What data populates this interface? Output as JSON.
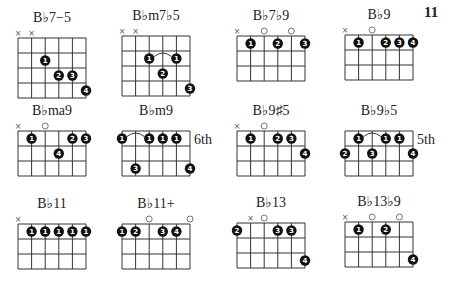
{
  "page_number": "11",
  "chords": [
    {
      "name": "B♭7−5",
      "x": 18,
      "y": 38,
      "frets": 4,
      "markers": [
        "x",
        "x",
        null,
        null,
        null,
        null
      ],
      "dots": [
        {
          "s": 2,
          "f": 2,
          "n": "1"
        },
        {
          "s": 3,
          "f": 3,
          "n": "2"
        },
        {
          "s": 4,
          "f": 3,
          "n": "3"
        },
        {
          "s": 5,
          "f": 4,
          "n": "4"
        }
      ]
    },
    {
      "name": "B♭m7♭5",
      "x": 122,
      "y": 36,
      "frets": 4,
      "markers": [
        "x",
        "x",
        null,
        null,
        null,
        null
      ],
      "dots": [
        {
          "s": 2,
          "f": 2,
          "n": "1"
        },
        {
          "s": 4,
          "f": 2,
          "n": "1"
        },
        {
          "s": 3,
          "f": 3,
          "n": "2"
        },
        {
          "s": 5,
          "f": 4,
          "n": "3"
        }
      ],
      "barre": {
        "from": 2,
        "to": 4,
        "f": 2
      }
    },
    {
      "name": "B♭7♭9",
      "x": 237,
      "y": 36,
      "frets": 3,
      "markers": [
        "x",
        null,
        "o",
        null,
        "o",
        null
      ],
      "dots": [
        {
          "s": 1,
          "f": 1,
          "n": "1"
        },
        {
          "s": 3,
          "f": 1,
          "n": "2"
        },
        {
          "s": 5,
          "f": 1,
          "n": "3"
        }
      ]
    },
    {
      "name": "B♭9",
      "x": 345,
      "y": 35,
      "frets": 3,
      "markers": [
        "x",
        null,
        "o",
        null,
        null,
        null
      ],
      "dots": [
        {
          "s": 1,
          "f": 1,
          "n": "1"
        },
        {
          "s": 3,
          "f": 1,
          "n": "2"
        },
        {
          "s": 4,
          "f": 1,
          "n": "3"
        },
        {
          "s": 5,
          "f": 1,
          "n": "4"
        }
      ]
    },
    {
      "name": "B♭ma9",
      "x": 18,
      "y": 131,
      "frets": 3,
      "markers": [
        "x",
        null,
        "o",
        null,
        null,
        null
      ],
      "dots": [
        {
          "s": 1,
          "f": 1,
          "n": "1"
        },
        {
          "s": 4,
          "f": 1,
          "n": "2"
        },
        {
          "s": 5,
          "f": 1,
          "n": "3"
        },
        {
          "s": 3,
          "f": 2,
          "n": "4"
        }
      ]
    },
    {
      "name": "B♭m9",
      "x": 122,
      "y": 131,
      "frets": 3,
      "position": "6th",
      "markers": [
        null,
        null,
        null,
        null,
        null,
        null
      ],
      "dots": [
        {
          "s": 0,
          "f": 1,
          "n": "1"
        },
        {
          "s": 2,
          "f": 1,
          "n": "1"
        },
        {
          "s": 3,
          "f": 1,
          "n": "1"
        },
        {
          "s": 4,
          "f": 1,
          "n": "1"
        },
        {
          "s": 1,
          "f": 3,
          "n": "3"
        },
        {
          "s": 5,
          "f": 3,
          "n": "4"
        }
      ],
      "barre": {
        "from": 0,
        "to": 2,
        "f": 1
      }
    },
    {
      "name": "B♭9♯5",
      "x": 237,
      "y": 131,
      "frets": 3,
      "markers": [
        "x",
        null,
        "o",
        null,
        null,
        null
      ],
      "dots": [
        {
          "s": 1,
          "f": 1,
          "n": "1"
        },
        {
          "s": 3,
          "f": 1,
          "n": "2"
        },
        {
          "s": 4,
          "f": 1,
          "n": "3"
        },
        {
          "s": 5,
          "f": 2,
          "n": "4"
        }
      ]
    },
    {
      "name": "B♭9♭5",
      "x": 345,
      "y": 131,
      "frets": 3,
      "position": "5th",
      "markers": [
        null,
        null,
        null,
        null,
        null,
        null
      ],
      "dots": [
        {
          "s": 1,
          "f": 1,
          "n": "1"
        },
        {
          "s": 3,
          "f": 1,
          "n": "1"
        },
        {
          "s": 4,
          "f": 1,
          "n": "1"
        },
        {
          "s": 0,
          "f": 2,
          "n": "2"
        },
        {
          "s": 2,
          "f": 2,
          "n": "3"
        },
        {
          "s": 5,
          "f": 2,
          "n": "4"
        }
      ],
      "barre": {
        "from": 1,
        "to": 3,
        "f": 1
      }
    },
    {
      "name": "B♭11",
      "x": 18,
      "y": 224,
      "frets": 3,
      "markers": [
        "x",
        null,
        null,
        null,
        null,
        null
      ],
      "dots": [
        {
          "s": 1,
          "f": 1,
          "n": "1"
        },
        {
          "s": 2,
          "f": 1,
          "n": "1"
        },
        {
          "s": 3,
          "f": 1,
          "n": "1"
        },
        {
          "s": 4,
          "f": 1,
          "n": "1"
        },
        {
          "s": 5,
          "f": 1,
          "n": "1"
        }
      ]
    },
    {
      "name": "B♭11+",
      "x": 122,
      "y": 224,
      "frets": 3,
      "markers": [
        null,
        null,
        "o",
        null,
        null,
        "o"
      ],
      "dots": [
        {
          "s": 0,
          "f": 1,
          "n": "1"
        },
        {
          "s": 1,
          "f": 1,
          "n": "2"
        },
        {
          "s": 3,
          "f": 1,
          "n": "3"
        },
        {
          "s": 4,
          "f": 1,
          "n": "4"
        }
      ]
    },
    {
      "name": "B♭13",
      "x": 237,
      "y": 223,
      "frets": 3,
      "markers": [
        null,
        "x",
        "o",
        null,
        null,
        null
      ],
      "dots": [
        {
          "s": 0,
          "f": 1,
          "n": "2"
        },
        {
          "s": 3,
          "f": 1,
          "n": "3"
        },
        {
          "s": 4,
          "f": 1,
          "n": "3"
        },
        {
          "s": 5,
          "f": 3,
          "n": "4"
        }
      ]
    },
    {
      "name": "B♭13♭9",
      "x": 345,
      "y": 222,
      "frets": 3,
      "markers": [
        "x",
        null,
        "o",
        null,
        "o",
        null
      ],
      "dots": [
        {
          "s": 1,
          "f": 1,
          "n": "1"
        },
        {
          "s": 3,
          "f": 1,
          "n": "2"
        },
        {
          "s": 5,
          "f": 3,
          "n": "4"
        }
      ]
    }
  ]
}
